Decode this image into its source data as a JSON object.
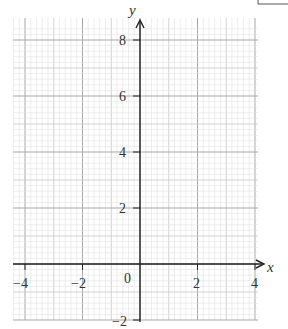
{
  "figure": {
    "type": "blank coordinate grid",
    "x_axis": {
      "label": "x",
      "min": -4,
      "max": 4,
      "tick_labels": [
        "-4",
        "-2",
        "2",
        "4"
      ],
      "tick_values": [
        -4,
        -2,
        2,
        4
      ]
    },
    "y_axis": {
      "label": "y",
      "min": -2,
      "max": 8,
      "tick_labels": [
        "-2",
        "2",
        "4",
        "6",
        "8"
      ],
      "tick_values": [
        -2,
        2,
        4,
        6,
        8
      ]
    },
    "origin_label": "0",
    "grid": {
      "minor_step": 0.2,
      "medium_step": 1,
      "major_step": 2
    },
    "colors": {
      "axis": "#222222",
      "major_grid": "#a8a8a8",
      "medium_grid": "#c8c8c8",
      "minor_grid": "#e2e2e2",
      "text": "#333333"
    }
  },
  "labels": {
    "x_axis": "x",
    "y_axis": "y",
    "origin": "0",
    "x_neg4": "−4",
    "x_neg2": "−2",
    "x_2": "2",
    "x_4": "4",
    "y_neg2": "−2",
    "y_2": "2",
    "y_4": "4",
    "y_6": "6",
    "y_8": "8"
  }
}
